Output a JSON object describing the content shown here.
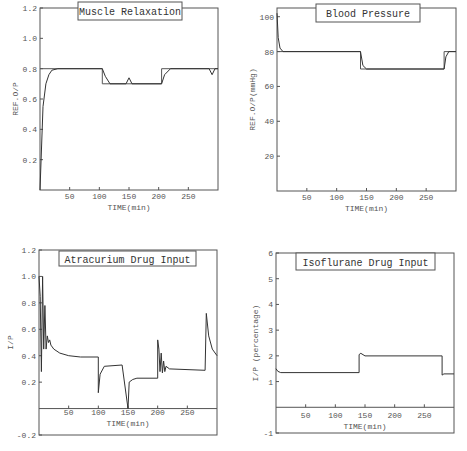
{
  "chart_data": [
    {
      "type": "line",
      "title": "Muscle Relaxation",
      "xlabel": "TIME(min)",
      "ylabel": "REF.O/P",
      "xlim": [
        0,
        300
      ],
      "ylim": [
        0,
        1.2
      ],
      "xticks": [
        "50",
        "100",
        "150",
        "200",
        "250"
      ],
      "yticks": [
        "0.2",
        "0.4",
        "0.6",
        "0.8",
        "1.0",
        "1.2"
      ],
      "series": [
        {
          "name": "Reference",
          "x": [
            0,
            105,
            105,
            205,
            205,
            300
          ],
          "values": [
            0.8,
            0.8,
            0.7,
            0.7,
            0.8,
            0.8
          ]
        },
        {
          "name": "Output",
          "x": [
            0,
            5,
            10,
            15,
            20,
            30,
            105,
            110,
            118,
            145,
            150,
            155,
            205,
            210,
            220,
            285,
            290,
            295,
            300
          ],
          "values": [
            0.0,
            0.55,
            0.7,
            0.76,
            0.79,
            0.8,
            0.8,
            0.75,
            0.7,
            0.7,
            0.74,
            0.7,
            0.7,
            0.76,
            0.8,
            0.8,
            0.76,
            0.8,
            0.8
          ]
        }
      ]
    },
    {
      "type": "line",
      "title": "Blood Pressure",
      "xlabel": "TIME(min)",
      "ylabel": "REF.O/P(mmHg)",
      "xlim": [
        0,
        300
      ],
      "ylim": [
        0,
        105
      ],
      "xticks": [
        "50",
        "100",
        "150",
        "200",
        "250"
      ],
      "yticks": [
        "20",
        "40",
        "60",
        "80",
        "100"
      ],
      "series": [
        {
          "name": "Reference",
          "x": [
            0,
            140,
            140,
            280,
            280,
            300
          ],
          "values": [
            80,
            80,
            70,
            70,
            80,
            80
          ]
        },
        {
          "name": "Output",
          "x": [
            0,
            2,
            5,
            10,
            140,
            144,
            150,
            280,
            283,
            288,
            300
          ],
          "values": [
            102,
            88,
            82,
            80,
            80,
            72,
            70,
            70,
            77,
            80,
            80
          ]
        }
      ]
    },
    {
      "type": "line",
      "title": "Atracurium Drug Input",
      "xlabel": "TIME(min)",
      "ylabel": "I/P",
      "xlim": [
        0,
        300
      ],
      "ylim": [
        -0.2,
        1.2
      ],
      "xticks": [
        "50",
        "100",
        "150",
        "200",
        "250"
      ],
      "yticks": [
        "-0.2",
        "0.2",
        "0.4",
        "0.6",
        "0.8",
        "1.0",
        "1.2"
      ],
      "series": [
        {
          "name": "Input",
          "x": [
            0,
            2,
            4,
            6,
            8,
            10,
            12,
            14,
            16,
            18,
            20,
            25,
            35,
            50,
            70,
            100,
            100,
            103,
            110,
            140,
            140,
            150,
            152,
            158,
            165,
            200,
            200,
            202,
            204,
            206,
            208,
            210,
            212,
            214,
            220,
            280,
            280,
            282,
            286,
            292,
            300
          ],
          "values": [
            1.0,
            0.85,
            0.28,
            1.0,
            0.45,
            0.78,
            0.45,
            0.55,
            0.5,
            0.52,
            0.48,
            0.45,
            0.42,
            0.4,
            0.39,
            0.39,
            0.12,
            0.26,
            0.32,
            0.33,
            0.33,
            0.0,
            0.2,
            0.22,
            0.23,
            0.23,
            0.52,
            0.45,
            0.28,
            0.42,
            0.27,
            0.36,
            0.28,
            0.32,
            0.3,
            0.29,
            0.29,
            0.72,
            0.55,
            0.45,
            0.4
          ]
        }
      ]
    },
    {
      "type": "line",
      "title": "Isoflurane Drug Input",
      "xlabel": "TIME(min)",
      "ylabel": "I/P (percentage)",
      "xlim": [
        0,
        300
      ],
      "ylim": [
        -1,
        6
      ],
      "xticks": [
        "50",
        "100",
        "150",
        "200",
        "250"
      ],
      "yticks": [
        "-1",
        "1",
        "2",
        "3",
        "4",
        "5",
        "6"
      ],
      "series": [
        {
          "name": "Input",
          "x": [
            0,
            3,
            8,
            140,
            140,
            143,
            150,
            280,
            280,
            283,
            300
          ],
          "values": [
            1.5,
            1.4,
            1.35,
            1.35,
            2.05,
            2.1,
            2.0,
            2.0,
            1.25,
            1.3,
            1.3
          ]
        }
      ]
    }
  ]
}
